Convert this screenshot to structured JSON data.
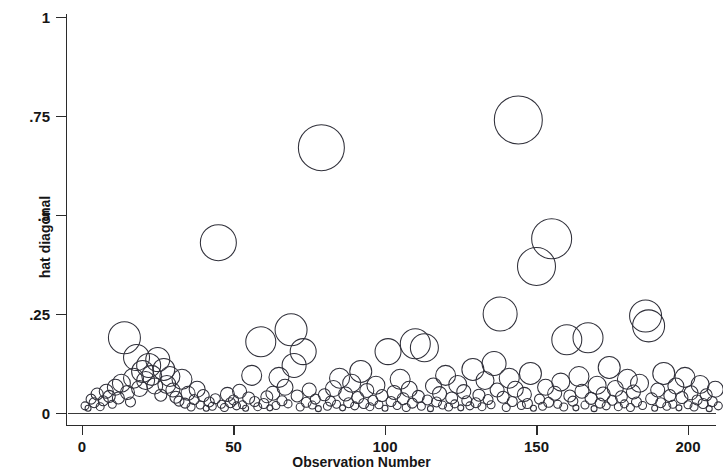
{
  "chart_data": {
    "type": "scatter",
    "title": "",
    "subtitle": "",
    "xlabel": "Observation Number",
    "ylabel": "hat diagonal",
    "xlim": [
      0,
      212
    ],
    "ylim": [
      0,
      1
    ],
    "xticks": [
      0,
      50,
      100,
      150,
      200
    ],
    "xticklabels": [
      "0",
      "50",
      "100",
      "150",
      "200"
    ],
    "yticks": [
      0,
      0.25,
      0.5,
      0.75,
      1
    ],
    "yticklabels": [
      "0",
      ".25",
      ".5",
      ".75",
      "1"
    ],
    "grid": false,
    "legend": null,
    "marker": "open-circle",
    "marker_color": "#30303a",
    "marker_fill": "none",
    "zero_reference_line": 0,
    "series": [
      {
        "name": "hat diagonal",
        "points": [
          {
            "x": 1,
            "y": 0.018,
            "r": 4
          },
          {
            "x": 2,
            "y": 0.012,
            "r": 3
          },
          {
            "x": 3,
            "y": 0.035,
            "r": 5
          },
          {
            "x": 4,
            "y": 0.026,
            "r": 5
          },
          {
            "x": 5,
            "y": 0.048,
            "r": 6
          },
          {
            "x": 6,
            "y": 0.016,
            "r": 4
          },
          {
            "x": 7,
            "y": 0.031,
            "r": 5
          },
          {
            "x": 8,
            "y": 0.055,
            "r": 7
          },
          {
            "x": 9,
            "y": 0.042,
            "r": 6
          },
          {
            "x": 10,
            "y": 0.022,
            "r": 4
          },
          {
            "x": 11,
            "y": 0.065,
            "r": 8
          },
          {
            "x": 12,
            "y": 0.038,
            "r": 6
          },
          {
            "x": 13,
            "y": 0.075,
            "r": 9
          },
          {
            "x": 14,
            "y": 0.19,
            "r": 16
          },
          {
            "x": 15,
            "y": 0.052,
            "r": 7
          },
          {
            "x": 16,
            "y": 0.028,
            "r": 5
          },
          {
            "x": 17,
            "y": 0.088,
            "r": 10
          },
          {
            "x": 18,
            "y": 0.14,
            "r": 13
          },
          {
            "x": 19,
            "y": 0.062,
            "r": 8
          },
          {
            "x": 20,
            "y": 0.105,
            "r": 11
          },
          {
            "x": 21,
            "y": 0.082,
            "r": 9
          },
          {
            "x": 22,
            "y": 0.12,
            "r": 12
          },
          {
            "x": 23,
            "y": 0.095,
            "r": 10
          },
          {
            "x": 24,
            "y": 0.068,
            "r": 8
          },
          {
            "x": 25,
            "y": 0.135,
            "r": 12
          },
          {
            "x": 26,
            "y": 0.045,
            "r": 6
          },
          {
            "x": 27,
            "y": 0.11,
            "r": 11
          },
          {
            "x": 28,
            "y": 0.072,
            "r": 9
          },
          {
            "x": 29,
            "y": 0.092,
            "r": 10
          },
          {
            "x": 30,
            "y": 0.058,
            "r": 7
          },
          {
            "x": 31,
            "y": 0.04,
            "r": 6
          },
          {
            "x": 32,
            "y": 0.03,
            "r": 5
          },
          {
            "x": 33,
            "y": 0.085,
            "r": 10
          },
          {
            "x": 34,
            "y": 0.025,
            "r": 5
          },
          {
            "x": 35,
            "y": 0.05,
            "r": 7
          },
          {
            "x": 36,
            "y": 0.015,
            "r": 4
          },
          {
            "x": 37,
            "y": 0.034,
            "r": 5
          },
          {
            "x": 38,
            "y": 0.06,
            "r": 8
          },
          {
            "x": 39,
            "y": 0.02,
            "r": 4
          },
          {
            "x": 40,
            "y": 0.044,
            "r": 6
          },
          {
            "x": 41,
            "y": 0.012,
            "r": 3
          },
          {
            "x": 42,
            "y": 0.028,
            "r": 5
          },
          {
            "x": 43,
            "y": 0.017,
            "r": 4
          },
          {
            "x": 44,
            "y": 0.036,
            "r": 5
          },
          {
            "x": 45,
            "y": 0.43,
            "r": 18
          },
          {
            "x": 46,
            "y": 0.022,
            "r": 4
          },
          {
            "x": 47,
            "y": 0.014,
            "r": 4
          },
          {
            "x": 48,
            "y": 0.047,
            "r": 7
          },
          {
            "x": 49,
            "y": 0.026,
            "r": 5
          },
          {
            "x": 50,
            "y": 0.033,
            "r": 5
          },
          {
            "x": 51,
            "y": 0.018,
            "r": 4
          },
          {
            "x": 52,
            "y": 0.055,
            "r": 7
          },
          {
            "x": 53,
            "y": 0.021,
            "r": 4
          },
          {
            "x": 54,
            "y": 0.012,
            "r": 3
          },
          {
            "x": 55,
            "y": 0.038,
            "r": 6
          },
          {
            "x": 56,
            "y": 0.095,
            "r": 10
          },
          {
            "x": 57,
            "y": 0.029,
            "r": 5
          },
          {
            "x": 58,
            "y": 0.016,
            "r": 4
          },
          {
            "x": 59,
            "y": 0.18,
            "r": 15
          },
          {
            "x": 60,
            "y": 0.024,
            "r": 5
          },
          {
            "x": 61,
            "y": 0.041,
            "r": 6
          },
          {
            "x": 62,
            "y": 0.013,
            "r": 3
          },
          {
            "x": 63,
            "y": 0.05,
            "r": 7
          },
          {
            "x": 64,
            "y": 0.019,
            "r": 4
          },
          {
            "x": 65,
            "y": 0.09,
            "r": 10
          },
          {
            "x": 66,
            "y": 0.031,
            "r": 5
          },
          {
            "x": 67,
            "y": 0.065,
            "r": 8
          },
          {
            "x": 68,
            "y": 0.023,
            "r": 4
          },
          {
            "x": 69,
            "y": 0.21,
            "r": 16
          },
          {
            "x": 70,
            "y": 0.12,
            "r": 12
          },
          {
            "x": 71,
            "y": 0.043,
            "r": 6
          },
          {
            "x": 72,
            "y": 0.015,
            "r": 4
          },
          {
            "x": 73,
            "y": 0.155,
            "r": 13
          },
          {
            "x": 74,
            "y": 0.027,
            "r": 5
          },
          {
            "x": 75,
            "y": 0.058,
            "r": 7
          },
          {
            "x": 76,
            "y": 0.02,
            "r": 4
          },
          {
            "x": 77,
            "y": 0.035,
            "r": 5
          },
          {
            "x": 78,
            "y": 0.011,
            "r": 3
          },
          {
            "x": 79,
            "y": 0.67,
            "r": 23
          },
          {
            "x": 80,
            "y": 0.046,
            "r": 6
          },
          {
            "x": 81,
            "y": 0.017,
            "r": 4
          },
          {
            "x": 82,
            "y": 0.03,
            "r": 5
          },
          {
            "x": 83,
            "y": 0.062,
            "r": 8
          },
          {
            "x": 84,
            "y": 0.022,
            "r": 4
          },
          {
            "x": 85,
            "y": 0.088,
            "r": 10
          },
          {
            "x": 86,
            "y": 0.013,
            "r": 3
          },
          {
            "x": 87,
            "y": 0.048,
            "r": 7
          },
          {
            "x": 88,
            "y": 0.026,
            "r": 5
          },
          {
            "x": 89,
            "y": 0.075,
            "r": 9
          },
          {
            "x": 90,
            "y": 0.018,
            "r": 4
          },
          {
            "x": 91,
            "y": 0.039,
            "r": 6
          },
          {
            "x": 92,
            "y": 0.105,
            "r": 11
          },
          {
            "x": 93,
            "y": 0.024,
            "r": 5
          },
          {
            "x": 94,
            "y": 0.057,
            "r": 7
          },
          {
            "x": 95,
            "y": 0.016,
            "r": 4
          },
          {
            "x": 96,
            "y": 0.032,
            "r": 5
          },
          {
            "x": 97,
            "y": 0.07,
            "r": 9
          },
          {
            "x": 98,
            "y": 0.021,
            "r": 4
          },
          {
            "x": 99,
            "y": 0.044,
            "r": 6
          },
          {
            "x": 100,
            "y": 0.012,
            "r": 3
          },
          {
            "x": 101,
            "y": 0.155,
            "r": 13
          },
          {
            "x": 102,
            "y": 0.029,
            "r": 5
          },
          {
            "x": 103,
            "y": 0.052,
            "r": 7
          },
          {
            "x": 104,
            "y": 0.019,
            "r": 4
          },
          {
            "x": 105,
            "y": 0.085,
            "r": 10
          },
          {
            "x": 106,
            "y": 0.036,
            "r": 6
          },
          {
            "x": 107,
            "y": 0.014,
            "r": 4
          },
          {
            "x": 108,
            "y": 0.06,
            "r": 8
          },
          {
            "x": 109,
            "y": 0.025,
            "r": 5
          },
          {
            "x": 110,
            "y": 0.175,
            "r": 15
          },
          {
            "x": 111,
            "y": 0.042,
            "r": 6
          },
          {
            "x": 112,
            "y": 0.017,
            "r": 4
          },
          {
            "x": 113,
            "y": 0.165,
            "r": 14
          },
          {
            "x": 114,
            "y": 0.033,
            "r": 5
          },
          {
            "x": 115,
            "y": 0.011,
            "r": 3
          },
          {
            "x": 116,
            "y": 0.068,
            "r": 8
          },
          {
            "x": 117,
            "y": 0.028,
            "r": 5
          },
          {
            "x": 118,
            "y": 0.049,
            "r": 7
          },
          {
            "x": 119,
            "y": 0.02,
            "r": 4
          },
          {
            "x": 120,
            "y": 0.095,
            "r": 10
          },
          {
            "x": 121,
            "y": 0.015,
            "r": 4
          },
          {
            "x": 122,
            "y": 0.038,
            "r": 6
          },
          {
            "x": 123,
            "y": 0.023,
            "r": 4
          },
          {
            "x": 124,
            "y": 0.072,
            "r": 9
          },
          {
            "x": 125,
            "y": 0.013,
            "r": 3
          },
          {
            "x": 126,
            "y": 0.054,
            "r": 7
          },
          {
            "x": 127,
            "y": 0.031,
            "r": 5
          },
          {
            "x": 128,
            "y": 0.018,
            "r": 4
          },
          {
            "x": 129,
            "y": 0.11,
            "r": 11
          },
          {
            "x": 130,
            "y": 0.026,
            "r": 5
          },
          {
            "x": 131,
            "y": 0.045,
            "r": 6
          },
          {
            "x": 132,
            "y": 0.016,
            "r": 4
          },
          {
            "x": 133,
            "y": 0.082,
            "r": 9
          },
          {
            "x": 134,
            "y": 0.034,
            "r": 5
          },
          {
            "x": 135,
            "y": 0.021,
            "r": 4
          },
          {
            "x": 136,
            "y": 0.125,
            "r": 12
          },
          {
            "x": 137,
            "y": 0.058,
            "r": 7
          },
          {
            "x": 138,
            "y": 0.25,
            "r": 17
          },
          {
            "x": 139,
            "y": 0.04,
            "r": 6
          },
          {
            "x": 140,
            "y": 0.014,
            "r": 4
          },
          {
            "x": 141,
            "y": 0.088,
            "r": 10
          },
          {
            "x": 142,
            "y": 0.029,
            "r": 5
          },
          {
            "x": 143,
            "y": 0.06,
            "r": 8
          },
          {
            "x": 144,
            "y": 0.74,
            "r": 24
          },
          {
            "x": 145,
            "y": 0.019,
            "r": 4
          },
          {
            "x": 146,
            "y": 0.047,
            "r": 7
          },
          {
            "x": 147,
            "y": 0.024,
            "r": 5
          },
          {
            "x": 148,
            "y": 0.1,
            "r": 11
          },
          {
            "x": 149,
            "y": 0.012,
            "r": 3
          },
          {
            "x": 150,
            "y": 0.37,
            "r": 19
          },
          {
            "x": 151,
            "y": 0.035,
            "r": 5
          },
          {
            "x": 152,
            "y": 0.017,
            "r": 4
          },
          {
            "x": 153,
            "y": 0.065,
            "r": 8
          },
          {
            "x": 154,
            "y": 0.027,
            "r": 5
          },
          {
            "x": 155,
            "y": 0.44,
            "r": 20
          },
          {
            "x": 156,
            "y": 0.05,
            "r": 7
          },
          {
            "x": 157,
            "y": 0.022,
            "r": 4
          },
          {
            "x": 158,
            "y": 0.078,
            "r": 9
          },
          {
            "x": 159,
            "y": 0.015,
            "r": 4
          },
          {
            "x": 160,
            "y": 0.185,
            "r": 15
          },
          {
            "x": 161,
            "y": 0.043,
            "r": 6
          },
          {
            "x": 162,
            "y": 0.03,
            "r": 5
          },
          {
            "x": 163,
            "y": 0.013,
            "r": 3
          },
          {
            "x": 164,
            "y": 0.092,
            "r": 10
          },
          {
            "x": 165,
            "y": 0.055,
            "r": 7
          },
          {
            "x": 166,
            "y": 0.02,
            "r": 4
          },
          {
            "x": 167,
            "y": 0.19,
            "r": 15
          },
          {
            "x": 168,
            "y": 0.037,
            "r": 6
          },
          {
            "x": 169,
            "y": 0.011,
            "r": 3
          },
          {
            "x": 170,
            "y": 0.07,
            "r": 9
          },
          {
            "x": 171,
            "y": 0.025,
            "r": 5
          },
          {
            "x": 172,
            "y": 0.048,
            "r": 7
          },
          {
            "x": 173,
            "y": 0.018,
            "r": 4
          },
          {
            "x": 174,
            "y": 0.115,
            "r": 11
          },
          {
            "x": 175,
            "y": 0.032,
            "r": 5
          },
          {
            "x": 176,
            "y": 0.062,
            "r": 8
          },
          {
            "x": 177,
            "y": 0.016,
            "r": 4
          },
          {
            "x": 178,
            "y": 0.041,
            "r": 6
          },
          {
            "x": 179,
            "y": 0.023,
            "r": 4
          },
          {
            "x": 180,
            "y": 0.085,
            "r": 10
          },
          {
            "x": 181,
            "y": 0.014,
            "r": 4
          },
          {
            "x": 182,
            "y": 0.053,
            "r": 7
          },
          {
            "x": 183,
            "y": 0.028,
            "r": 5
          },
          {
            "x": 184,
            "y": 0.075,
            "r": 9
          },
          {
            "x": 185,
            "y": 0.019,
            "r": 4
          },
          {
            "x": 186,
            "y": 0.245,
            "r": 16
          },
          {
            "x": 187,
            "y": 0.22,
            "r": 16
          },
          {
            "x": 188,
            "y": 0.036,
            "r": 6
          },
          {
            "x": 189,
            "y": 0.012,
            "r": 3
          },
          {
            "x": 190,
            "y": 0.058,
            "r": 7
          },
          {
            "x": 191,
            "y": 0.026,
            "r": 5
          },
          {
            "x": 192,
            "y": 0.1,
            "r": 11
          },
          {
            "x": 193,
            "y": 0.017,
            "r": 4
          },
          {
            "x": 194,
            "y": 0.044,
            "r": 6
          },
          {
            "x": 195,
            "y": 0.022,
            "r": 4
          },
          {
            "x": 196,
            "y": 0.068,
            "r": 8
          },
          {
            "x": 197,
            "y": 0.013,
            "r": 3
          },
          {
            "x": 198,
            "y": 0.039,
            "r": 6
          },
          {
            "x": 199,
            "y": 0.09,
            "r": 10
          },
          {
            "x": 200,
            "y": 0.021,
            "r": 4
          },
          {
            "x": 201,
            "y": 0.051,
            "r": 7
          },
          {
            "x": 202,
            "y": 0.015,
            "r": 4
          },
          {
            "x": 203,
            "y": 0.033,
            "r": 5
          },
          {
            "x": 204,
            "y": 0.072,
            "r": 9
          },
          {
            "x": 205,
            "y": 0.024,
            "r": 5
          },
          {
            "x": 206,
            "y": 0.046,
            "r": 6
          },
          {
            "x": 207,
            "y": 0.011,
            "r": 3
          },
          {
            "x": 208,
            "y": 0.029,
            "r": 5
          },
          {
            "x": 209,
            "y": 0.06,
            "r": 8
          },
          {
            "x": 210,
            "y": 0.018,
            "r": 4
          }
        ]
      }
    ]
  }
}
